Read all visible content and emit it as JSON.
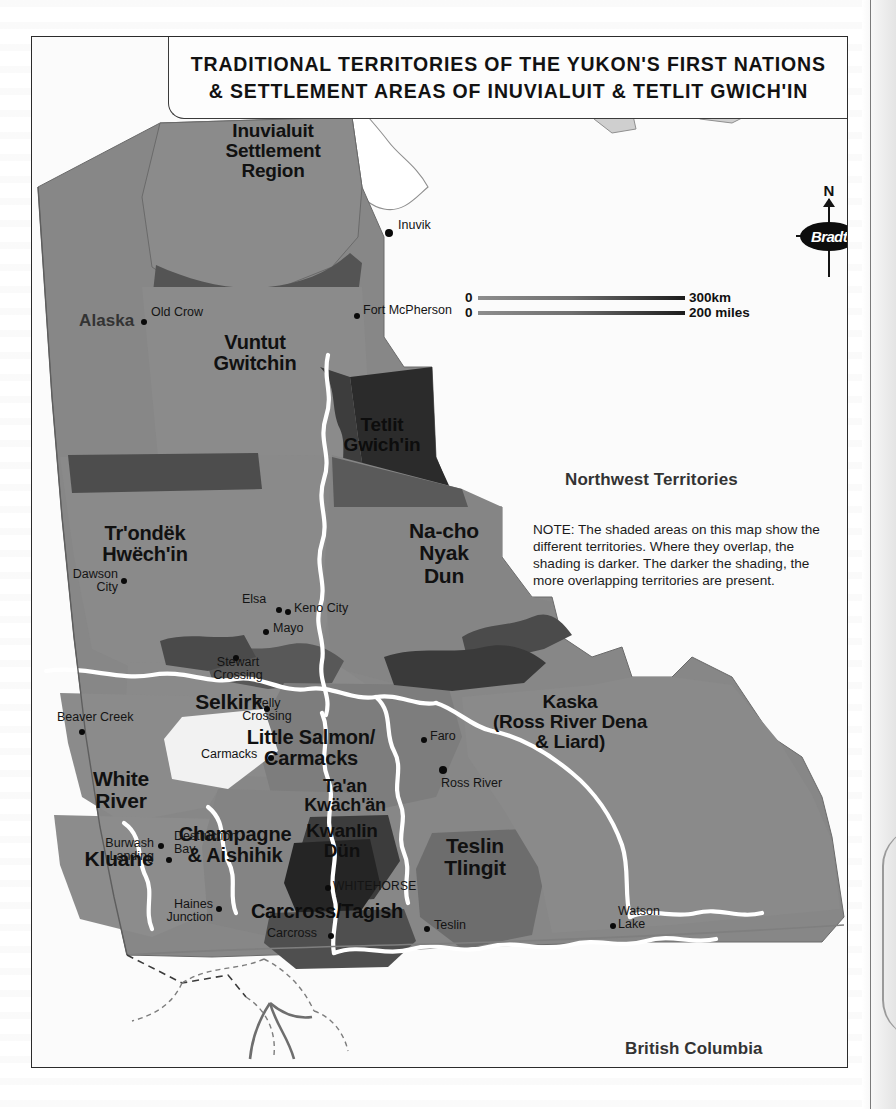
{
  "map": {
    "title_line1": "TRADITIONAL TERRITORIES OF THE YUKON'S FIRST NATIONS",
    "title_line2": "& SETTLEMENT AREAS OF INUVIALUIT & TETLIT GWICH'IN",
    "source": "Source: Yukon Government",
    "note": "NOTE: The shaded areas on this map show the different territories. Where they overlap, the shading is darker. The darker the shading, the more overlapping territories are present.",
    "brand": "Bradt",
    "compass_north": "N",
    "scale": {
      "km": {
        "zero": "0",
        "label": "300km"
      },
      "miles": {
        "zero": "0",
        "label": "200 miles"
      }
    },
    "neighbours": [
      {
        "name": "Alaska"
      },
      {
        "name": "Northwest Territories"
      },
      {
        "name": "British Columbia"
      }
    ],
    "territories": [
      {
        "name": "Inuvialuit\nSettlement\nRegion",
        "lines": [
          "Inuvialuit",
          "Settlement",
          "Region"
        ],
        "size": 19
      },
      {
        "name": "Vuntut Gwitchin",
        "lines": [
          "Vuntut",
          "Gwitchin"
        ],
        "size": 20
      },
      {
        "name": "Tetlit Gwich'in",
        "lines": [
          "Tetlit",
          "Gwich'in"
        ],
        "size": 19
      },
      {
        "name": "Tr'ondëk Hwëch'in",
        "lines": [
          "Tr'ondëk",
          "Hwëch'in"
        ],
        "size": 20
      },
      {
        "name": "Na-cho Nyak Dun",
        "lines": [
          "Na-cho",
          "Nyak",
          "Dun"
        ],
        "size": 21
      },
      {
        "name": "Selkirk",
        "lines": [
          "Selkirk"
        ],
        "size": 21
      },
      {
        "name": "Little Salmon/ Carmacks",
        "lines": [
          "Little Salmon/",
          "Carmacks"
        ],
        "size": 20
      },
      {
        "name": "White River",
        "lines": [
          "White",
          "River"
        ],
        "size": 21
      },
      {
        "name": "Kluane",
        "lines": [
          "Kluane"
        ],
        "size": 21
      },
      {
        "name": "Champagne & Aishihik",
        "lines": [
          "Champagne",
          "& Aishihik"
        ],
        "size": 20
      },
      {
        "name": "Ta'an Kwäch'än",
        "lines": [
          "Ta'an",
          "Kwäch'än"
        ],
        "size": 18
      },
      {
        "name": "Kwanlin Dün",
        "lines": [
          "Kwanlin",
          "Dün"
        ],
        "size": 19
      },
      {
        "name": "Carcross/Tagish",
        "lines": [
          "Carcross/Tagish"
        ],
        "size": 20
      },
      {
        "name": "Teslin Tlingit",
        "lines": [
          "Teslin",
          "Tlingit"
        ],
        "size": 21
      },
      {
        "name": "Kaska (Ross River Dena & Liard)",
        "lines": [
          "Kaska",
          "(Ross River Dena",
          "& Liard)"
        ],
        "size": 19
      }
    ],
    "places": [
      {
        "name": "Inuvik"
      },
      {
        "name": "Old Crow"
      },
      {
        "name": "Fort McPherson"
      },
      {
        "name": "Dawson City",
        "lines": [
          "Dawson",
          "City"
        ]
      },
      {
        "name": "Elsa"
      },
      {
        "name": "Keno City"
      },
      {
        "name": "Mayo"
      },
      {
        "name": "Stewart Crossing",
        "lines": [
          "Stewart",
          "Crossing"
        ]
      },
      {
        "name": "Pelly Crossing",
        "lines": [
          "Pelly",
          "Crossing"
        ]
      },
      {
        "name": "Beaver Creek"
      },
      {
        "name": "Carmacks"
      },
      {
        "name": "Faro"
      },
      {
        "name": "Ross River"
      },
      {
        "name": "Burwash Landing",
        "lines": [
          "Burwash",
          "Landing"
        ]
      },
      {
        "name": "Destruction Bay",
        "lines": [
          "Destruction",
          "Bay"
        ]
      },
      {
        "name": "Haines Junction",
        "lines": [
          "Haines",
          "Junction"
        ]
      },
      {
        "name": "WHITEHORSE"
      },
      {
        "name": "Carcross"
      },
      {
        "name": "Teslin"
      },
      {
        "name": "Watson Lake",
        "lines": [
          "Watson",
          "Lake"
        ]
      }
    ],
    "colors": {
      "shade_base": "#878787",
      "shade_mid": "#6f6f6f",
      "shade_dark": "#4a4a4a",
      "shade_darkest": "#262626",
      "land_outline": "#bfbfbf",
      "river": "#ffffff",
      "frame": "#2b2b2b",
      "paper": "#fbfbfb"
    }
  }
}
